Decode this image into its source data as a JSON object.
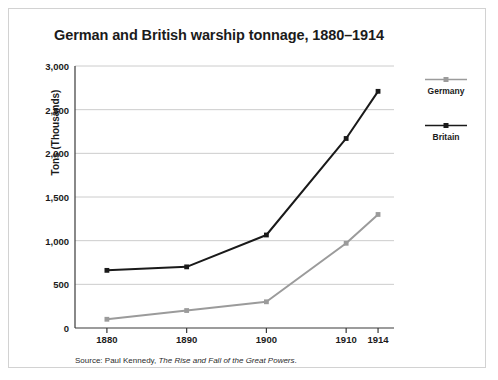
{
  "figure": {
    "title": "German and British warship tonnage, 1880–1914",
    "source_prefix": "Source: Paul Kennedy, ",
    "source_book": "The Rise and Fall of the Great Powers",
    "source_suffix": "."
  },
  "legend": {
    "position": "right",
    "entries": [
      {
        "label": "Germany",
        "color": "#9b9b9b"
      },
      {
        "label": "Britain",
        "color": "#1a1a1a"
      }
    ]
  },
  "chart_data": {
    "type": "line",
    "title": "German and British warship tonnage, 1880–1914",
    "xlabel": "",
    "ylabel": "Tons (Thousands)",
    "x": [
      1880,
      1890,
      1900,
      1910,
      1914
    ],
    "categories": [
      "1880",
      "1890",
      "1900",
      "1910",
      "1914"
    ],
    "xlim": [
      1876,
      1916
    ],
    "ylim": [
      0,
      3000
    ],
    "ytick_labels": [
      "0",
      "500",
      "1,000",
      "1,500",
      "2,000",
      "2,500",
      "3,000"
    ],
    "ytick_values": [
      0,
      500,
      1000,
      1500,
      2000,
      2500,
      3000
    ],
    "grid": "horizontal",
    "series": [
      {
        "name": "Germany",
        "color": "#9b9b9b",
        "marker": "square",
        "values": [
          100,
          200,
          300,
          970,
          1300
        ]
      },
      {
        "name": "Britain",
        "color": "#1a1a1a",
        "marker": "square",
        "values": [
          660,
          700,
          1065,
          2170,
          2710
        ]
      }
    ]
  }
}
